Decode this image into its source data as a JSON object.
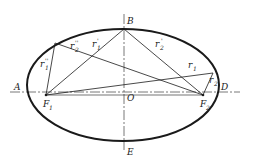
{
  "diagram": {
    "type": "ellipse-foci-construction",
    "points": {
      "A": "A",
      "B": "B",
      "D": "D",
      "E": "E",
      "O": "O",
      "F1": "F",
      "F1_sub": "1",
      "F2": "F",
      "F2_sub": "2"
    },
    "radii_labels": {
      "r1_pp": "r",
      "r1_pp_sub": "1",
      "r1_pp_mark": "''",
      "r2_pp": "r",
      "r2_pp_sub": "2",
      "r2_pp_mark": "''",
      "r1_p": "r",
      "r1_p_sub": "1",
      "r1_p_mark": "'",
      "r2_p": "r",
      "r2_p_sub": "2",
      "r2_p_mark": "'",
      "r1": "r",
      "r1_sub": "1",
      "r2": "r",
      "r2_sub": "2"
    },
    "colors": {
      "stroke": "#1a1a1a",
      "axis": "#555555"
    }
  }
}
